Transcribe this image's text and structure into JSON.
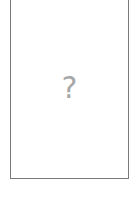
{
  "placeholder": {
    "state": "missing-image",
    "glyph": "?",
    "icon": "question-mark-icon",
    "border_color": "#7a7a7a",
    "glyph_color": "#a8a8a8",
    "background_color": "#ffffff"
  },
  "caption": {
    "text": ""
  }
}
